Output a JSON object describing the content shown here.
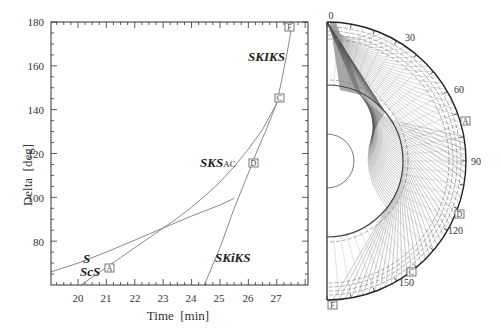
{
  "chart_data": [
    {
      "type": "line",
      "title": "",
      "xlabel": "Time  [min]",
      "ylabel": "Delta  [deg]",
      "xlim": [
        19.05,
        28.1
      ],
      "ylim": [
        60,
        180
      ],
      "xticks": [
        20,
        21,
        22,
        23,
        24,
        25,
        26,
        27
      ],
      "yticks": [
        80,
        100,
        120,
        140,
        160,
        180
      ],
      "grid": false,
      "series": [
        {
          "name": "S",
          "x": [
            19.05,
            20,
            21,
            22,
            23,
            24,
            25,
            25.5
          ],
          "y": [
            66,
            70,
            75,
            80.5,
            86,
            91.5,
            96.5,
            99.5
          ]
        },
        {
          "name": "ScS",
          "x": [
            20.1,
            20.5,
            21,
            21.5,
            22,
            22.5,
            23,
            23.5
          ],
          "y": [
            60,
            63.5,
            68,
            72.5,
            77,
            81.5,
            86,
            90.5
          ]
        },
        {
          "name": "SKS_AC",
          "x": [
            23.5,
            24,
            24.5,
            25,
            25.5,
            26,
            26.5,
            27
          ],
          "y": [
            90.5,
            95.5,
            101,
            107,
            114,
            122,
            131,
            143
          ]
        },
        {
          "name": "SKiKS",
          "x": [
            24.45,
            25,
            25.5,
            26,
            26.3,
            26.6,
            27
          ],
          "y": [
            60,
            77,
            95,
            111,
            121,
            130,
            143
          ]
        },
        {
          "name": "SKIKS",
          "x": [
            27,
            27.2,
            27.35,
            27.45,
            27.55
          ],
          "y": [
            143,
            155,
            165,
            172,
            180
          ]
        }
      ],
      "annotations": [
        {
          "text": "S",
          "x": 20.3,
          "y": 73
        },
        {
          "text": "ScS",
          "x": 20.3,
          "y": 66
        },
        {
          "text": "SKS",
          "sub": "AC",
          "x": 24.8,
          "y": 117
        },
        {
          "text": "SKiKS",
          "x": 24.6,
          "y": 69
        },
        {
          "text": "SKIKS",
          "x": 25.7,
          "y": 167
        }
      ],
      "point_markers": [
        {
          "label": "A",
          "x": 21.1,
          "y": 68
        },
        {
          "label": "D",
          "x": 26.1,
          "y": 117
        },
        {
          "label": "C",
          "x": 27.1,
          "y": 146
        },
        {
          "label": "F",
          "x": 27.45,
          "y": 178
        }
      ]
    },
    {
      "type": "polar-raypath",
      "title": "",
      "angle_labels": [
        "0",
        "30",
        "60",
        "90",
        "120",
        "150"
      ],
      "angle_range_deg": [
        0,
        180
      ],
      "core_radius_ratio": 0.546,
      "inner_core_radius_ratio": 0.19,
      "point_markers": [
        {
          "label": "A",
          "angle_deg": 78
        },
        {
          "label": "D",
          "angle_deg": 113
        },
        {
          "label": "C",
          "angle_deg": 143
        },
        {
          "label": "F",
          "angle_deg": 180
        }
      ]
    }
  ],
  "left_plot": {
    "xlabel": "Time  [min]",
    "ylabel": "Delta  [deg]",
    "xtick_labels": [
      "20",
      "21",
      "22",
      "23",
      "24",
      "25",
      "26",
      "27"
    ],
    "ytick_labels": [
      "80",
      "100",
      "120",
      "140",
      "160",
      "180"
    ],
    "phases": {
      "s": "S",
      "scs": "ScS",
      "sks_main": "SKS",
      "sks_sub": "AC",
      "skiks": "SKiKS",
      "skiks_upper": "SKIKS"
    },
    "markers": {
      "a": "A",
      "d": "D",
      "c": "C",
      "f": "F"
    }
  },
  "right_plot": {
    "angle_labels": {
      "a0": "0",
      "a30": "30",
      "a60": "60",
      "a90": "90",
      "a120": "120",
      "a150": "150"
    },
    "markers": {
      "a": "A",
      "d": "D",
      "c": "C",
      "f": "F"
    }
  },
  "colors": {
    "axis": "#333333",
    "curve": "#8a8a8a",
    "ray_dark": "#555555",
    "ray_light": "#9a9a9a",
    "shade": "#9c9c9c"
  }
}
